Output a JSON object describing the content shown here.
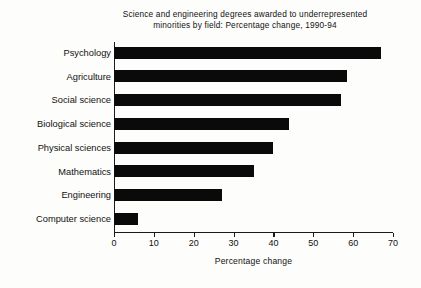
{
  "chart_data": {
    "type": "bar",
    "orientation": "horizontal",
    "title": "Science and engineering degrees awarded to underrepresented minorities by field: Percentage change, 1990-94",
    "title_line1": "Science and engineering degrees awarded to underrepresented",
    "title_line2": "minorities by field: Percentage change, 1990-94",
    "xlabel": "Percentage change",
    "ylabel": "",
    "categories": [
      "Psychology",
      "Agriculture",
      "Social science",
      "Biological science",
      "Physical sciences",
      "Mathematics",
      "Engineering",
      "Computer science"
    ],
    "values": [
      67,
      58.5,
      57,
      44,
      40,
      35,
      27,
      6
    ],
    "xlim": [
      0,
      70
    ],
    "xticks": [
      0,
      10,
      20,
      30,
      40,
      50,
      60,
      70
    ],
    "xtick_labels": [
      "0",
      "10",
      "20",
      "30",
      "40",
      "50",
      "60",
      "70"
    ],
    "grid": false,
    "legend": null,
    "bar_color": "#0a0a0a",
    "axis_color": "#1a1a1a",
    "background_color": "#fdfdfb"
  }
}
